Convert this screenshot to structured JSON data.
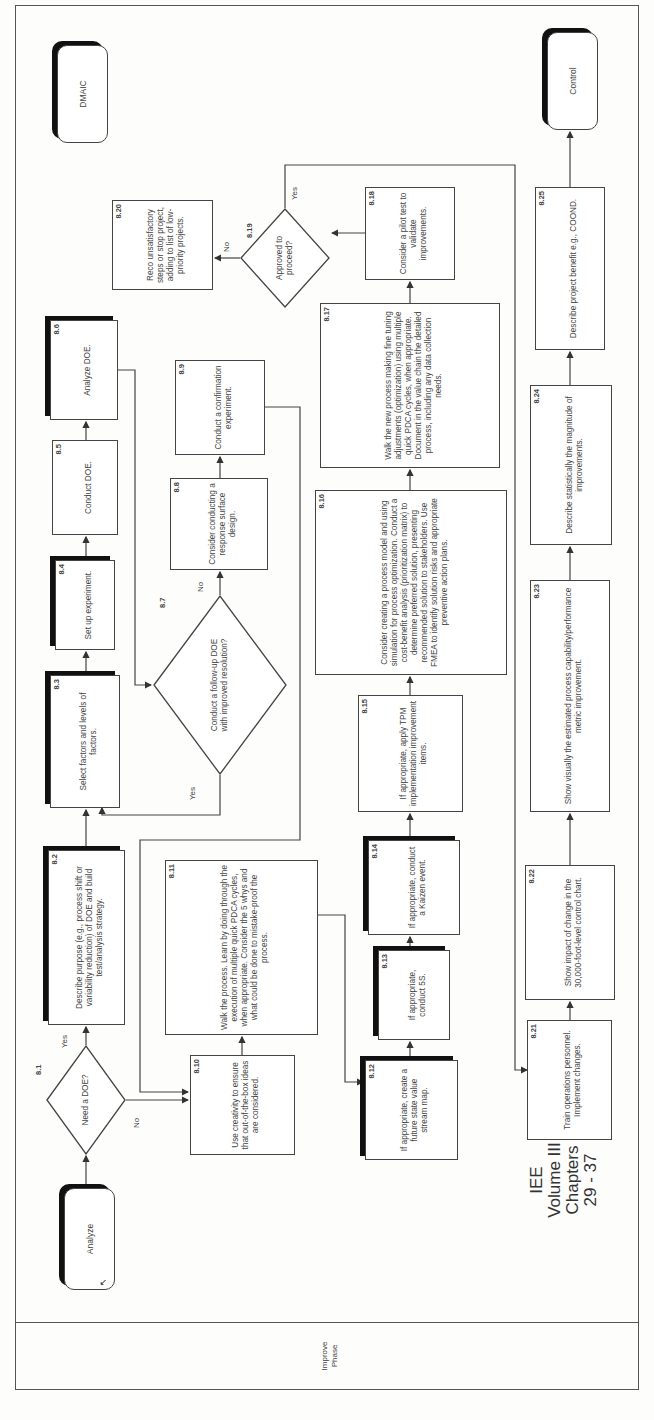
{
  "phase": {
    "label_line1": "Improve",
    "label_line2": "Phase"
  },
  "watermark": {
    "line1": "IEE",
    "line2": "Volume III",
    "line3": "Chapters",
    "line4": "29 - 37"
  },
  "terminals": {
    "start": "Analyze",
    "previous": "DMAIC",
    "next": "Control"
  },
  "steps": {
    "s8_1": {
      "num": "8.1",
      "text": "Need a DOE?"
    },
    "s8_2": {
      "num": "8.2",
      "text": "Describe purpose (e.g., process shift or variability reduction) of DOE and build test/analysis strategy."
    },
    "s8_3": {
      "num": "8.3",
      "text": "Select factors and levels of factors."
    },
    "s8_4": {
      "num": "8.4",
      "text": "Set up experiment."
    },
    "s8_5": {
      "num": "8.5",
      "text": "Conduct DOE."
    },
    "s8_6": {
      "num": "8.6",
      "text": "Analyze DOE."
    },
    "s8_7": {
      "num": "8.7",
      "text": "Conduct a follow-up DOE with improved resolution?"
    },
    "s8_8": {
      "num": "8.8",
      "text": "Consider conducting a response surface design."
    },
    "s8_9": {
      "num": "8.9",
      "text": "Conduct a confirmation experiment."
    },
    "s8_10": {
      "num": "8.10",
      "text": "Use creativity to ensure that out-of-the-box ideas are considered."
    },
    "s8_11": {
      "num": "8.11",
      "text": "Walk the process. Learn by doing through the execution of multiple quick PDCA cycles, when appropriate. Consider the 5 whys and what could be done to mistake-proof the process."
    },
    "s8_12": {
      "num": "8.12",
      "text": "If appropriate, create a future state value stream map."
    },
    "s8_13": {
      "num": "8.13",
      "text": "If appropriate, conduct 5S."
    },
    "s8_14": {
      "num": "8.14",
      "text": "If appropriate, conduct a Kaizen event."
    },
    "s8_15": {
      "num": "8.15",
      "text": "If appropriate, apply TPM implementation improvement items."
    },
    "s8_16": {
      "num": "8.16",
      "text": "Consider creating a process model and using simulation for process optimization. Conduct a cost-benefit analysis (prioritization matrix) to determine preferred solution, presenting recommended solution to stakeholders. Use FMEA to identify solution risks and appropriate preventive action plans."
    },
    "s8_17": {
      "num": "8.17",
      "text": "Walk the new process making fine tuning adjustments (optimization) using multiple quick PDCA cycles, when appropriate. Document in the value chain the detailed process, including any data collection needs."
    },
    "s8_18": {
      "num": "8.18",
      "text": "Consider a pilot test to validate improvements."
    },
    "s8_19": {
      "num": "8.19",
      "text": "Approved to proceed?"
    },
    "s8_20": {
      "num": "8.20",
      "text": "Reco unsatisfactory steps or stop project, adding to list of low-priority projects."
    },
    "s8_21": {
      "num": "8.21",
      "text": "Train operations personnel. Implement changes."
    },
    "s8_22": {
      "num": "8.22",
      "text": "Show impact of change in the 30,000-foot-level control chart."
    },
    "s8_23": {
      "num": "8.23",
      "text": "Show visually the estimated process capability/performance metric improvement."
    },
    "s8_24": {
      "num": "8.24",
      "text": "Describe statistically the magnitude of improvements."
    },
    "s8_25": {
      "num": "8.25",
      "text": "Describe project benefit e.g., COOND."
    }
  },
  "branch_labels": {
    "d8_1_yes": "Yes",
    "d8_1_no": "No",
    "d8_7_yes": "Yes",
    "d8_7_no": "No",
    "d8_19_yes": "Yes",
    "d8_19_no": "No"
  },
  "colors": {
    "line": "#444444",
    "shadow": "#111111",
    "background": "#fdfdfb"
  }
}
